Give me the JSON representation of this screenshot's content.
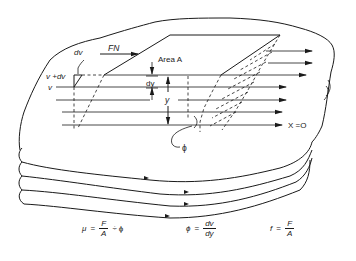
{
  "diagram": {
    "labels": {
      "dv": "dv",
      "v_plus_dv": "v +dv",
      "v": "v",
      "force": "FN",
      "area": "Area A",
      "dy": "dy",
      "y": "y",
      "x_origin": "X =O",
      "phi": "ϕ"
    },
    "equations": [
      {
        "lhs": "μ",
        "eq": "=",
        "num": "F",
        "den": "A",
        "tail_op": "÷",
        "tail": "ϕ"
      },
      {
        "lhs": "ϕ",
        "eq": "=",
        "num": "dv",
        "den": "dy"
      },
      {
        "lhs": "f",
        "eq": "=",
        "num": "F",
        "den": "A"
      }
    ],
    "colors": {
      "ink": "#1a1a1a",
      "paper": "#ffffff"
    },
    "flow_lines": 8,
    "stacked_layers": 4
  }
}
